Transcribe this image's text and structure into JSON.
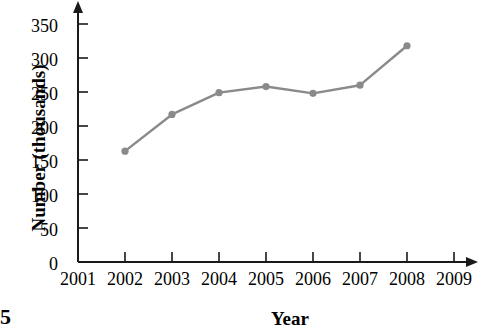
{
  "page_number": "5",
  "chart_data": {
    "type": "line",
    "title": "",
    "xlabel": "Year",
    "ylabel": "Number (thousands)",
    "x": [
      2002,
      2003,
      2004,
      2005,
      2006,
      2007,
      2008
    ],
    "values": [
      163,
      217,
      249,
      258,
      248,
      260,
      318
    ],
    "series": [
      {
        "name": "Number (thousands)",
        "values": [
          163,
          217,
          249,
          258,
          248,
          260,
          318
        ]
      }
    ],
    "categories": [
      "2002",
      "2003",
      "2004",
      "2005",
      "2006",
      "2007",
      "2008"
    ],
    "xlim": [
      2001,
      2009
    ],
    "ylim": [
      0,
      350
    ],
    "x_tick_labels": [
      "2001",
      "2002",
      "2003",
      "2004",
      "2005",
      "2006",
      "2007",
      "2008",
      "2009"
    ],
    "y_tick_labels": [
      "0",
      "50",
      "100",
      "150",
      "200",
      "250",
      "300",
      "350"
    ],
    "y_ticks": [
      0,
      50,
      100,
      150,
      200,
      250,
      300,
      350
    ],
    "grid": false,
    "legend": "none",
    "line_color": "#8a8a8a",
    "marker_color": "#8a8a8a",
    "axis_color": "#1a1a1a",
    "axis_arrows": [
      "up",
      "right"
    ]
  }
}
